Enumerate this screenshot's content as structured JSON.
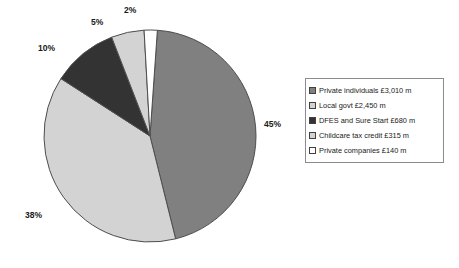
{
  "chart_data": {
    "type": "pie",
    "title": "",
    "legend_position": "right",
    "categories": [
      "Private individuals £3,010 m",
      "Local govt £2,450 m",
      "DFES and Sure Start £680 m",
      "Childcare tax credit £315 m",
      "Private companies £140 m"
    ],
    "values": [
      45,
      38,
      10,
      5,
      2
    ],
    "value_unit": "%",
    "amounts_gbp_millions": [
      3010,
      2450,
      680,
      315,
      140
    ],
    "data_labels": [
      "45%",
      "38%",
      "10%",
      "5%",
      "2%"
    ],
    "colors": [
      "#808080",
      "#d3d3d3",
      "#333333",
      "#d3d3d3",
      "#ffffff"
    ],
    "slices": [
      {
        "label": "Private individuals £3,010 m",
        "short": "Private individuals",
        "amount": "£3,010 m",
        "percent": 45,
        "data_label": "45%",
        "color": "#808080"
      },
      {
        "label": "Local govt £2,450 m",
        "short": "Local govt",
        "amount": "£2,450 m",
        "percent": 38,
        "data_label": "38%",
        "color": "#d3d3d3"
      },
      {
        "label": "DFES and Sure Start £680 m",
        "short": "DFES and Sure Start",
        "amount": "£680 m",
        "percent": 10,
        "data_label": "10%",
        "color": "#333333"
      },
      {
        "label": "Childcare tax credit £315 m",
        "short": "Childcare tax credit",
        "amount": "£315 m",
        "percent": 5,
        "data_label": "5%",
        "color": "#d3d3d3"
      },
      {
        "label": "Private companies £140 m",
        "short": "Private companies",
        "amount": "£140 m",
        "percent": 2,
        "data_label": "2%",
        "color": "#ffffff"
      }
    ],
    "geometry": {
      "cx": 150,
      "cy": 136,
      "r": 106,
      "start_angle_deg": -86,
      "direction": "clockwise",
      "stroke": "#4d4d4d"
    },
    "label_positions": [
      {
        "text": "45%",
        "left": 264,
        "top": 119
      },
      {
        "text": "38%",
        "left": 25,
        "top": 210
      },
      {
        "text": "10%",
        "left": 38,
        "top": 43
      },
      {
        "text": "5%",
        "left": 91,
        "top": 17
      },
      {
        "text": "2%",
        "left": 124,
        "top": 5
      }
    ]
  },
  "legend": {
    "box": {
      "left": 305,
      "top": 78,
      "width": 139
    },
    "border_color": "#8c8c8c"
  }
}
